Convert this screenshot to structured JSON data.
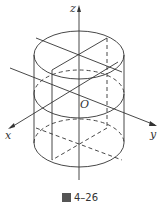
{
  "figure": {
    "caption_label": "图",
    "caption_number": "4–26",
    "axes": {
      "x": "x",
      "y": "y",
      "z": "z",
      "origin": "O"
    },
    "colors": {
      "stroke": "#333333",
      "background": "#ffffff"
    }
  }
}
